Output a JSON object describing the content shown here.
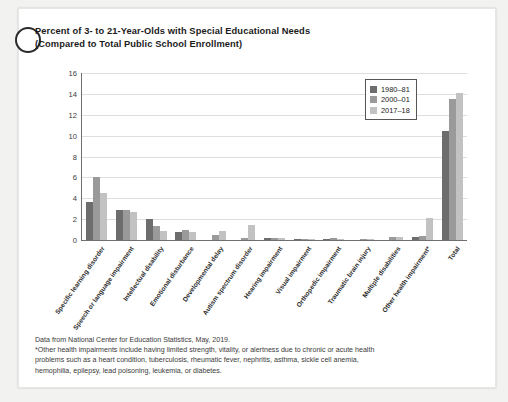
{
  "card": {
    "title_line1": "Percent of 3- to 21-Year-Olds with Special Educational Needs",
    "title_line2": "(Compared to Total Public School Enrollment)"
  },
  "legend": {
    "position": "top-right",
    "entries": [
      {
        "label": "1980–81",
        "color": "#6d6d6d"
      },
      {
        "label": "2000–01",
        "color": "#9a9a9a"
      },
      {
        "label": "2017–18",
        "color": "#c2c2c2"
      }
    ]
  },
  "footnote": {
    "line1": "Data from National Center for Education Statistics, May, 2019.",
    "line2": "*Other health impairments include having limited strength, vitality, or alertness due to chronic or acute health",
    "line3": "problems such as a heart condition, tuberculosis, rheumatic fever, nephritis, asthma, sickle cell anemia,",
    "line4": "hemophilia, epilepsy, lead poisoning, leukemia, or diabetes."
  },
  "chart_data": {
    "type": "bar",
    "title": "Percent of 3- to 21-Year-Olds with Special Educational Needs (Compared to Total Public School Enrollment)",
    "xlabel": "",
    "ylabel": "",
    "ylim": [
      0,
      16
    ],
    "yticks": [
      0,
      2,
      4,
      6,
      8,
      10,
      12,
      14,
      16
    ],
    "grid": true,
    "legend_position": "top-right",
    "categories": [
      "Specific learning disorder",
      "Speech or language impairment",
      "Intellectual disability",
      "Emotional disturbance",
      "Developmental delay",
      "Autism spectrum disorder",
      "Hearing impairment",
      "Visual impairment",
      "Orthopedic impairment",
      "Traumatic brain injury",
      "Multiple disabilities",
      "Other health impairment*",
      "Total"
    ],
    "series": [
      {
        "name": "1980–81",
        "color": "#6d6d6d",
        "values": [
          3.6,
          2.85,
          2.0,
          0.8,
          0.0,
          0.0,
          0.2,
          0.1,
          0.1,
          0.0,
          0.0,
          0.3,
          10.4
        ]
      },
      {
        "name": "2000–01",
        "color": "#9a9a9a",
        "values": [
          6.05,
          2.85,
          1.3,
          1.0,
          0.45,
          0.2,
          0.15,
          0.05,
          0.15,
          0.05,
          0.25,
          0.4,
          13.55
        ]
      },
      {
        "name": "2017–18",
        "color": "#c2c2c2",
        "values": [
          4.5,
          2.7,
          0.85,
          0.75,
          0.85,
          1.4,
          0.15,
          0.05,
          0.1,
          0.05,
          0.25,
          2.1,
          14.05
        ]
      }
    ]
  }
}
